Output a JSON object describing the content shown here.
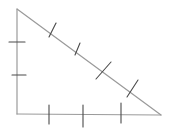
{
  "diagram": {
    "title": "",
    "colors": {
      "side_stroke": "#9a9a9a",
      "tick_stroke": "#4a4a4a",
      "background": "#ffffff"
    },
    "vertices": {
      "top": [
        17,
        9
      ],
      "bottom_left": [
        17,
        114
      ],
      "bottom_right": [
        161,
        115
      ]
    },
    "sides": [
      {
        "name": "left-side",
        "from": "top",
        "to": "bottom_left",
        "tick_count": 2,
        "ticks": [
          [
            [
              9,
              42
            ],
            [
              25,
              42
            ]
          ],
          [
            [
              12,
              75
            ],
            [
              26,
              75
            ]
          ]
        ]
      },
      {
        "name": "bottom-side",
        "from": "bottom_left",
        "to": "bottom_right",
        "tick_count": 3,
        "ticks": [
          [
            [
              49,
              105
            ],
            [
              49,
              124
            ]
          ],
          [
            [
              83,
              105
            ],
            [
              83,
              127
            ]
          ],
          [
            [
              121,
              103
            ],
            [
              121,
              123
            ]
          ]
        ]
      },
      {
        "name": "hypotenuse",
        "from": "top",
        "to": "bottom_right",
        "tick_count": 4,
        "ticks": [
          [
            [
              56,
              23
            ],
            [
              49,
              37
            ]
          ],
          [
            [
              80,
              43
            ],
            [
              75,
              55
            ]
          ],
          [
            [
              111,
              62
            ],
            [
              96,
              79
            ]
          ],
          [
            [
              138,
              80
            ],
            [
              127,
              97
            ]
          ]
        ]
      }
    ]
  }
}
